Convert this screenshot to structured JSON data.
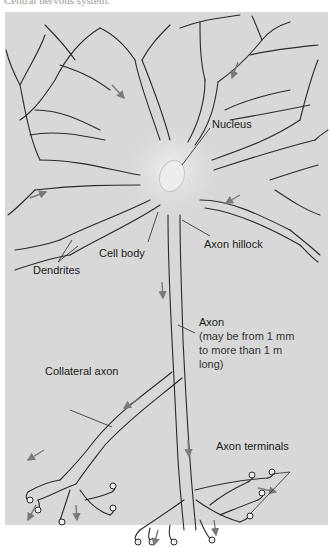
{
  "header": {
    "caption_partial": "Central nervous system."
  },
  "figure": {
    "type": "neuron-diagram",
    "background_color": "#d8d8d8",
    "line_color": "#2a2a2a",
    "arrow_color": "#7a7a7a",
    "labels": {
      "nucleus": "Nucleus",
      "cell_body": "Cell body",
      "axon_hillock": "Axon hillock",
      "dendrites": "Dendrites",
      "axon": "Axon",
      "axon_note_1": "(may be from 1 mm",
      "axon_note_2": "to more than 1 m",
      "axon_note_3": "long)",
      "collateral_axon": "Collateral axon",
      "axon_terminals": "Axon terminals"
    }
  }
}
